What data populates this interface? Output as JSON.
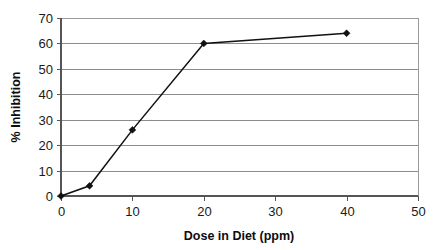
{
  "chart_data": {
    "type": "line",
    "title": "",
    "subtitle": "",
    "xlabel": "Dose in Diet (ppm)",
    "ylabel": "% Inhibition",
    "xlim": [
      0,
      50
    ],
    "ylim": [
      0,
      70
    ],
    "xticks": [
      0,
      10,
      20,
      30,
      40,
      50
    ],
    "yticks": [
      0,
      10,
      20,
      30,
      40,
      50,
      60,
      70
    ],
    "xtick_labels": [
      "0",
      "10",
      "20",
      "30",
      "40",
      "50"
    ],
    "ytick_labels": [
      "0",
      "10",
      "20",
      "30",
      "40",
      "50",
      "60",
      "70"
    ],
    "grid": {
      "horizontal": true,
      "vertical": false,
      "color": "#8c8c8c"
    },
    "legend": {
      "visible": false,
      "position": "none",
      "entries": []
    },
    "marker": "diamond",
    "series": [
      {
        "name": "% Inhibition",
        "color": "#111111",
        "x": [
          0,
          4,
          10,
          20,
          40
        ],
        "y": [
          0,
          4,
          26,
          60,
          64
        ],
        "points": [
          {
            "x": 0,
            "y": 0
          },
          {
            "x": 4,
            "y": 4
          },
          {
            "x": 10,
            "y": 26
          },
          {
            "x": 20,
            "y": 60
          },
          {
            "x": 40,
            "y": 64
          }
        ]
      }
    ],
    "annotations": []
  },
  "plot": {
    "background": "#ffffff",
    "border_color": "#9a9a9a",
    "axis_color": "#555555"
  }
}
